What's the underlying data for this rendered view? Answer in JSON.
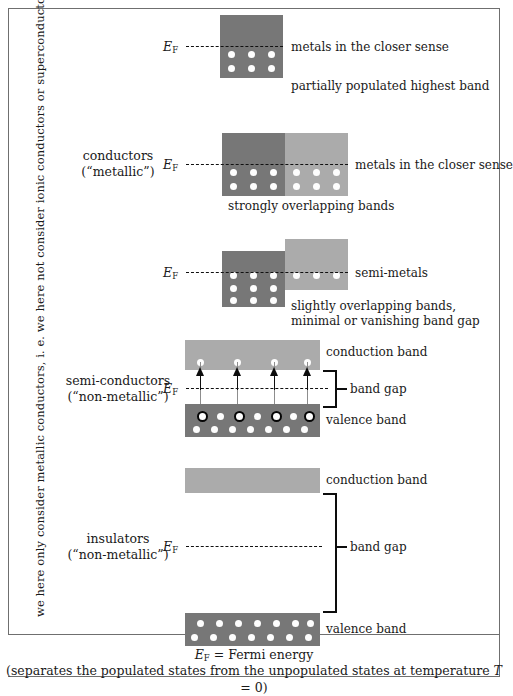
{
  "figure": {
    "side_note": "we here only consider metallic conductors, i. e. we here not consider ionic conductors or superconductors",
    "caption_line1_symbol": "E",
    "caption_line1_sub": "F",
    "caption_line1_rest": " = Fermi energy",
    "caption_line2_pre": "(separates the populated states from the unpopulated states at temperature ",
    "caption_line2_var": "T",
    "caption_line2_post": " = 0)"
  },
  "fermi": {
    "symbol": "E",
    "subscript": "F"
  },
  "categories": [
    {
      "id": "conductors",
      "line1": "conductors",
      "line2": "(“metallic”)"
    },
    {
      "id": "semiconductors",
      "line1": "semi-conductors",
      "line2": "(“non-metallic”)"
    },
    {
      "id": "insulators",
      "line1": "insulators",
      "line2": "(“non-metallic”)"
    }
  ],
  "rows": [
    {
      "id": "metals-partial",
      "right_label": "metals in the closer sense",
      "sub_label": "partially populated highest band"
    },
    {
      "id": "metals-overlapping",
      "right_label": "metals in the closer sense",
      "sub_label": "strongly overlapping bands"
    },
    {
      "id": "semi-metals",
      "right_label": "semi-metals",
      "sub_label_line1": "slightly overlapping bands,",
      "sub_label_line2": "minimal or vanishing band gap"
    },
    {
      "id": "semiconductor",
      "conduction_label": "conduction band",
      "gap_label": "band gap",
      "valence_label": "valence band"
    },
    {
      "id": "insulator",
      "conduction_label": "conduction band",
      "gap_label": "band gap",
      "valence_label": "valence band"
    }
  ],
  "colors": {
    "band_dark": "#777777",
    "band_light": "#ababab",
    "dot": "#fdfdfd",
    "line": "#101010",
    "frame": "#6f6f6f",
    "text": "#1a1a1a"
  }
}
